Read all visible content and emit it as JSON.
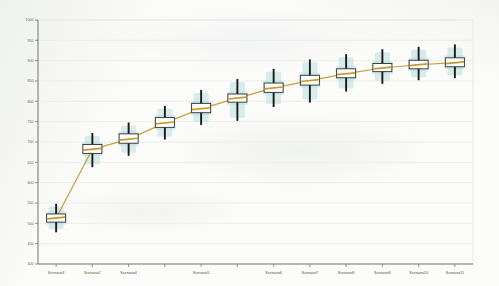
{
  "chart_data": {
    "type": "box",
    "title": "",
    "xlabel": "",
    "ylabel": "",
    "ylim": [
      400,
      1000
    ],
    "yticks": [
      400,
      450,
      500,
      550,
      600,
      650,
      700,
      750,
      800,
      850,
      900,
      950,
      1000
    ],
    "ytick_labels": [
      "400",
      "450",
      "500",
      "550",
      "600",
      "650",
      "700",
      "750",
      "800",
      "850",
      "900",
      "950",
      "1000"
    ],
    "grid": true,
    "grid_axis": "y",
    "legend": "none",
    "categories": [
      "Scenario3",
      "Scenario2",
      "Scenario4",
      "Scenario5",
      "Scenario6",
      "Scenario7",
      "Scenario8",
      "Scenario9",
      "Scenario10",
      "Scenario11",
      "Scenario12"
    ],
    "x_tick_labels": [
      "Scenario3",
      "Scenario2",
      "Scenario4",
      "Scenario5",
      "Scenario6",
      "Scenario7",
      "Scenario8",
      "Scenario9",
      "Scenario10",
      "Scenario11",
      "Scenario12"
    ],
    "n_boxes": 12,
    "boxes": [
      {
        "label": "Scenario3",
        "whisker_low": 478,
        "q1": 503,
        "median": 513,
        "q3": 523,
        "whisker_high": 548
      },
      {
        "label": "Scenario2",
        "whisker_low": 638,
        "q1": 672,
        "median": 682,
        "q3": 694,
        "whisker_high": 722
      },
      {
        "label": "Scenario4",
        "whisker_low": 666,
        "q1": 697,
        "median": 707,
        "q3": 720,
        "whisker_high": 748
      },
      {
        "label": "",
        "whisker_low": 706,
        "q1": 736,
        "median": 747,
        "q3": 760,
        "whisker_high": 789
      },
      {
        "label": "Scenario5",
        "whisker_low": 742,
        "q1": 772,
        "median": 782,
        "q3": 795,
        "whisker_high": 828
      },
      {
        "label": "",
        "whisker_low": 752,
        "q1": 798,
        "median": 808,
        "q3": 818,
        "whisker_high": 855
      },
      {
        "label": "Scenario6",
        "whisker_low": 786,
        "q1": 822,
        "median": 833,
        "q3": 845,
        "whisker_high": 880
      },
      {
        "label": "Scenario7",
        "whisker_low": 797,
        "q1": 840,
        "median": 851,
        "q3": 864,
        "whisker_high": 903
      },
      {
        "label": "Scenario8",
        "whisker_low": 824,
        "q1": 858,
        "median": 868,
        "q3": 880,
        "whisker_high": 916
      },
      {
        "label": "Scenario9",
        "whisker_low": 843,
        "q1": 873,
        "median": 882,
        "q3": 893,
        "whisker_high": 928
      },
      {
        "label": "Scenario10",
        "whisker_low": 852,
        "q1": 880,
        "median": 890,
        "q3": 901,
        "whisker_high": 934
      },
      {
        "label": "Scenario11",
        "whisker_low": 857,
        "q1": 885,
        "median": 895,
        "q3": 907,
        "whisker_high": 940
      }
    ],
    "median_trend_line": {
      "name": "median trend",
      "color": "#c8982f",
      "values": [
        513,
        682,
        707,
        747,
        782,
        808,
        833,
        851,
        868,
        882,
        890,
        895
      ]
    },
    "colors": {
      "box_fill": "#ffffff",
      "box_edge": "#2e2e2e",
      "median_line": "#c8982f",
      "whisker": "#1a1a1a",
      "density_band": "#b9dee0",
      "grid": "#e4e9e6",
      "axis": "#7a7a7a",
      "paper": "#fcfcfa"
    }
  }
}
